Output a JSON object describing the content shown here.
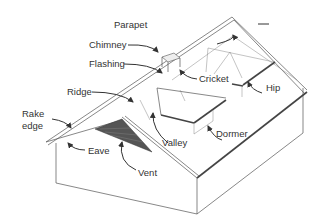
{
  "diagram": {
    "labels": {
      "parapet": "Parapet",
      "chimney": "Chimney",
      "flashing": "Flashing",
      "cricket": "Cricket",
      "hip": "Hip",
      "ridge": "Ridge",
      "rake_edge_1": "Rake",
      "rake_edge_2": "edge",
      "valley": "Valley",
      "dormer": "Dormer",
      "eave": "Eave",
      "vent": "Vent"
    },
    "colors": {
      "line": "#555555",
      "text": "#333333",
      "vent_fill": "#555555",
      "background": "#ffffff"
    }
  }
}
